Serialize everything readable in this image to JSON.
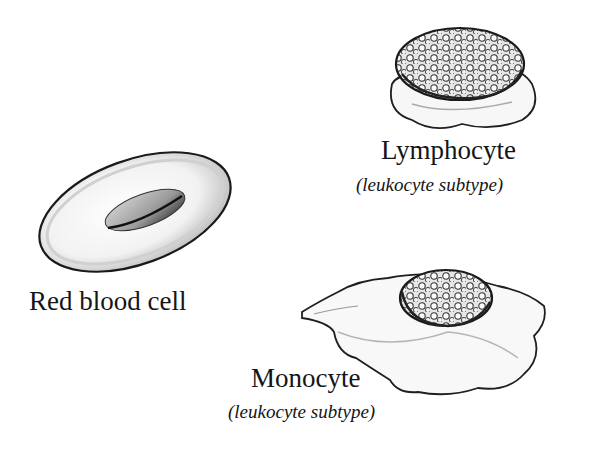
{
  "diagram": {
    "cells": [
      {
        "id": "red-blood-cell",
        "label": "Red blood cell",
        "subtitle": null
      },
      {
        "id": "lymphocyte",
        "label": "Lymphocyte",
        "subtitle": "(leukocyte subtype)"
      },
      {
        "id": "monocyte",
        "label": "Monocyte",
        "subtitle": "(leukocyte subtype)"
      }
    ],
    "colors": {
      "background": "#ffffff",
      "ink": "#151515",
      "shade": "#9a9a9a"
    }
  }
}
